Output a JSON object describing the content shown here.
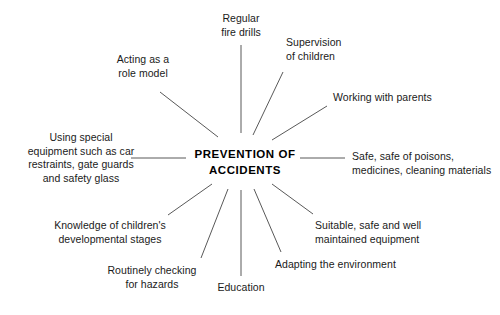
{
  "diagram": {
    "type": "spoke-hub-mind-map",
    "title": "PREVENTION OF ACCIDENTS",
    "background_color": "#ffffff",
    "line_color": "#595959",
    "text_color": "#1a1a1a",
    "hub": {
      "label": "PREVENTION OF\nACCIDENTS",
      "x": 245,
      "y": 162
    },
    "nodes": [
      {
        "id": "acting-as-a-role-model",
        "label": "Acting as a\nrole model",
        "x": 143,
        "y": 53,
        "align": "center",
        "spoke": {
          "x1": 160,
          "y1": 92,
          "x2": 218,
          "y2": 137
        }
      },
      {
        "id": "regular-fire-drills",
        "label": "Regular\nfire drills",
        "x": 241,
        "y": 12,
        "align": "center",
        "spoke": {
          "x1": 241,
          "y1": 45,
          "x2": 241,
          "y2": 133
        }
      },
      {
        "id": "supervision-of-children",
        "label": "Supervision\nof children",
        "x": 286,
        "y": 36,
        "align": "left",
        "spoke": {
          "x1": 283,
          "y1": 72,
          "x2": 253,
          "y2": 135
        }
      },
      {
        "id": "working-with-parents",
        "label": "Working with parents",
        "x": 333,
        "y": 91,
        "align": "left",
        "spoke": {
          "x1": 327,
          "y1": 106,
          "x2": 272,
          "y2": 140
        }
      },
      {
        "id": "safe-safe-of-poisons",
        "label": "Safe, safe of poisons,\nmedicines, cleaning materials",
        "x": 352,
        "y": 150,
        "align": "left",
        "spoke": {
          "x1": 345,
          "y1": 158,
          "x2": 300,
          "y2": 158
        }
      },
      {
        "id": "suitable-safe-well-maintained-equipment",
        "label": "Suitable, safe and well\nmaintained equipment",
        "x": 315,
        "y": 219,
        "align": "left",
        "spoke": {
          "x1": 313,
          "y1": 214,
          "x2": 272,
          "y2": 184
        }
      },
      {
        "id": "adapting-the-environment",
        "label": "Adapting the environment",
        "x": 275,
        "y": 258,
        "align": "left",
        "spoke": {
          "x1": 281,
          "y1": 252,
          "x2": 254,
          "y2": 189
        }
      },
      {
        "id": "education",
        "label": "Education",
        "x": 241,
        "y": 281,
        "align": "center",
        "spoke": {
          "x1": 241,
          "y1": 276,
          "x2": 241,
          "y2": 190
        }
      },
      {
        "id": "routinely-checking-for-hazards",
        "label": "Routinely checking\nfor hazards",
        "x": 152,
        "y": 264,
        "align": "center",
        "spoke": {
          "x1": 201,
          "y1": 258,
          "x2": 228,
          "y2": 189
        }
      },
      {
        "id": "knowledge-of-childrens-developmental-stages",
        "label": "Knowledge of children's\ndevelopmental stages",
        "x": 110,
        "y": 219,
        "align": "center",
        "spoke": {
          "x1": 168,
          "y1": 215,
          "x2": 212,
          "y2": 184
        }
      },
      {
        "id": "using-special-equipment",
        "label": "Using special\nequipment such as car\nrestraints, gate guards\nand safety glass",
        "x": 81,
        "y": 131,
        "align": "center",
        "spoke": {
          "x1": 131,
          "y1": 158,
          "x2": 186,
          "y2": 158
        }
      }
    ]
  }
}
